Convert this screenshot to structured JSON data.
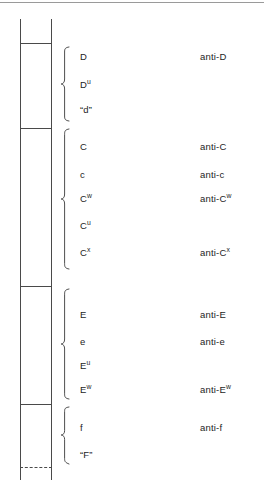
{
  "diagram": {
    "line_color": "#4a4a4a",
    "text_color": "#1d1d1d",
    "background": "#ffffff"
  },
  "groups": [
    {
      "id": "d-group",
      "name": "D locus",
      "antigens": [
        {
          "symbol": "D",
          "sup": "",
          "y": 52
        },
        {
          "symbol": "D",
          "sup": "u",
          "y": 80
        },
        {
          "symbol": "“d”",
          "sup": "",
          "y": 105
        }
      ],
      "antibodies": [
        {
          "symbol": "anti-D",
          "sup": "",
          "y": 52
        }
      ]
    },
    {
      "id": "c-group",
      "name": "C locus",
      "antigens": [
        {
          "symbol": "C",
          "sup": "",
          "y": 142
        },
        {
          "symbol": "c",
          "sup": "",
          "y": 170
        },
        {
          "symbol": "C",
          "sup": "w",
          "y": 194
        },
        {
          "symbol": "C",
          "sup": "u",
          "y": 221
        },
        {
          "symbol": "C",
          "sup": "x",
          "y": 248
        }
      ],
      "antibodies": [
        {
          "symbol": "anti-C",
          "sup": "",
          "y": 142
        },
        {
          "symbol": "anti-c",
          "sup": "",
          "y": 170
        },
        {
          "symbol": "anti-C",
          "sup": "w",
          "y": 194
        },
        {
          "symbol": "anti-C",
          "sup": "x",
          "y": 248
        }
      ]
    },
    {
      "id": "e-group",
      "name": "E locus",
      "antigens": [
        {
          "symbol": "E",
          "sup": "",
          "y": 310
        },
        {
          "symbol": "e",
          "sup": "",
          "y": 337
        },
        {
          "symbol": "E",
          "sup": "u",
          "y": 361
        },
        {
          "symbol": "E",
          "sup": "w",
          "y": 385
        }
      ],
      "antibodies": [
        {
          "symbol": "anti-E",
          "sup": "",
          "y": 310
        },
        {
          "symbol": "anti-e",
          "sup": "",
          "y": 337
        },
        {
          "symbol": "anti-E",
          "sup": "w",
          "y": 385
        }
      ]
    },
    {
      "id": "f-group",
      "name": "f locus",
      "antigens": [
        {
          "symbol": "f",
          "sup": "",
          "y": 423
        },
        {
          "symbol": "“F”",
          "sup": "",
          "y": 450
        }
      ],
      "antibodies": [
        {
          "symbol": "anti-f",
          "sup": "",
          "y": 423
        }
      ]
    }
  ],
  "bar": {
    "left_x": 20,
    "right_x": 51,
    "top_y": 19,
    "bottom_y": 480,
    "crossbars": [
      43,
      128,
      286,
      404
    ],
    "dashed_crossbar": 467
  },
  "braces": [
    {
      "id": "brace-d",
      "top": 46,
      "bottom": 122,
      "mid": 84
    },
    {
      "id": "brace-c",
      "top": 128,
      "bottom": 270,
      "mid": 206
    },
    {
      "id": "brace-e",
      "top": 288,
      "bottom": 400,
      "mid": 348
    },
    {
      "id": "brace-f",
      "top": 406,
      "bottom": 465,
      "mid": 437
    }
  ]
}
